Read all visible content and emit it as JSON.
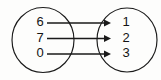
{
  "diagram": {
    "type": "mapping-diagram",
    "title": "",
    "stroke_color": "#1a1a1a",
    "text_color": "#141414",
    "background_color": "#fdfdfc",
    "domain_set": {
      "name": "domain",
      "elements": [
        {
          "label": "6",
          "x": 40,
          "y": 23
        },
        {
          "label": "7",
          "x": 40,
          "y": 38.5
        },
        {
          "label": "0",
          "x": 40,
          "y": 54
        }
      ],
      "ellipse": {
        "cx": 43,
        "cy": 40,
        "rx": 31,
        "ry": 32.5
      }
    },
    "codomain_set": {
      "name": "codomain",
      "elements": [
        {
          "label": "1",
          "x": 126,
          "y": 23
        },
        {
          "label": "2",
          "x": 126,
          "y": 38.5
        },
        {
          "label": "3",
          "x": 126,
          "y": 54
        }
      ],
      "ellipse": {
        "cx": 127,
        "cy": 40,
        "rx": 30,
        "ry": 32
      }
    },
    "arrows": [
      {
        "from": "6",
        "to": "1",
        "x1": 47,
        "x2": 111,
        "y": 23
      },
      {
        "from": "7",
        "to": "2",
        "x1": 47,
        "x2": 111,
        "y": 38.5
      },
      {
        "from": "0",
        "to": "3",
        "x1": 47,
        "x2": 111,
        "y": 54
      }
    ]
  }
}
